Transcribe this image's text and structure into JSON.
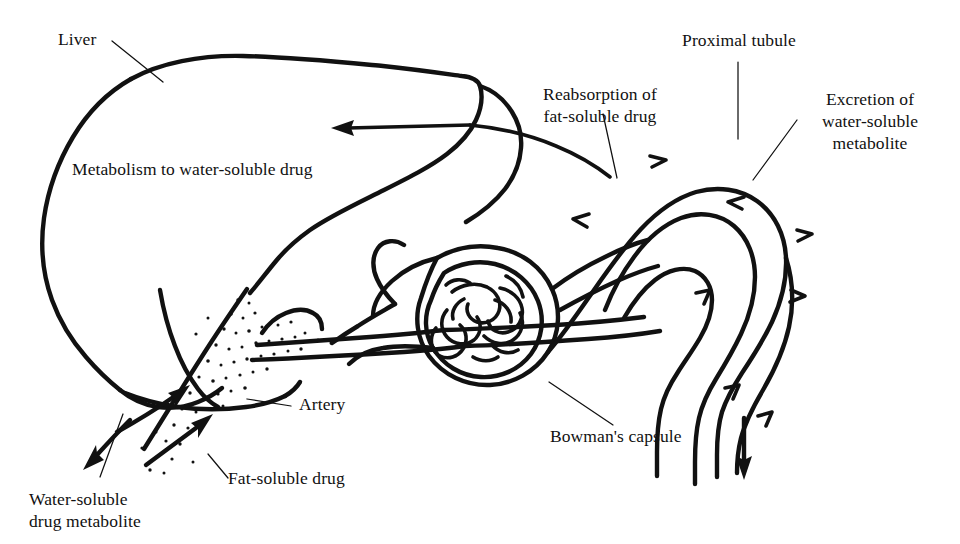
{
  "figure": {
    "background_color": "#ffffff",
    "ink_color": "#111111",
    "width": 960,
    "height": 544
  },
  "labels": {
    "liver": "Liver",
    "metabolism": "Metabolism to water-soluble drug",
    "water_soluble_metabolite": "Water-soluble\ndrug metabolite",
    "fat_soluble_drug": "Fat-soluble drug",
    "artery": "Artery",
    "reabsorption": "Reabsorption of\nfat-soluble drug",
    "bowmans_capsule": "Bowman's capsule",
    "proximal_tubule": "Proximal tubule",
    "excretion": "Excretion of\nwater-soluble\nmetabolite"
  },
  "diagram_structures": [
    {
      "name": "liver",
      "type": "organ-outline",
      "description": "Large irregular hand-drawn liver lobe occupying the left half of the figure"
    },
    {
      "name": "hepatic-artery-vessel",
      "type": "vessel",
      "description": "Stippled (dotted) vessel entering the liver from the lower right, carrying fat-soluble drug"
    },
    {
      "name": "renal-artery",
      "type": "vessel",
      "description": "Two long parallel lines running right from the liver hilum to the glomerulus"
    },
    {
      "name": "glomerulus",
      "type": "capillary-tuft",
      "description": "Tangled knot of capillary loops drawn inside a circular capsule"
    },
    {
      "name": "bowmans-capsule",
      "type": "capsule",
      "description": "Double-walled cup enclosing the glomerulus, opening into the proximal tubule"
    },
    {
      "name": "proximal-tubule",
      "type": "tubule",
      "description": "Looping double-walled tubule arching over to the right and descending"
    }
  ],
  "flow_arrows": [
    {
      "name": "metabolite-return-arrow",
      "direction": "left",
      "meaning": "water-soluble metabolite returning into liver region"
    },
    {
      "name": "artery-inflow-arrow-upper",
      "direction": "up-right",
      "meaning": "fat-soluble drug entering liver"
    },
    {
      "name": "artery-inflow-arrow-lower",
      "direction": "up-right",
      "meaning": "fat-soluble drug entering liver"
    },
    {
      "name": "metabolite-outflow-arrow",
      "direction": "down-left",
      "meaning": "water-soluble drug metabolite leaving liver"
    },
    {
      "name": "tubule-flow-arrow-top",
      "direction": "right",
      "meaning": "filtrate flow along proximal tubule"
    },
    {
      "name": "tubule-reabsorption-arrow",
      "direction": "left",
      "meaning": "reabsorption of fat-soluble drug out of tubule"
    },
    {
      "name": "tubule-flow-arrow-mid",
      "direction": "right",
      "meaning": "filtrate flow continuing"
    },
    {
      "name": "tubule-flow-arrow-lower",
      "direction": "down-right",
      "meaning": "filtrate descending"
    },
    {
      "name": "excretion-arrow",
      "direction": "down",
      "meaning": "excretion of water-soluble metabolite in urine"
    }
  ]
}
